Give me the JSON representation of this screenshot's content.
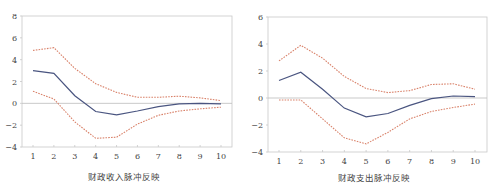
{
  "chart_data": [
    {
      "type": "line",
      "title": "财政收入脉冲反映",
      "xlabel": "财政收入脉冲反映",
      "ylabel": "",
      "x": [
        1,
        2,
        3,
        4,
        5,
        6,
        7,
        8,
        9,
        10
      ],
      "xticks": [
        "1",
        "2",
        "3",
        "4",
        "5",
        "6",
        "7",
        "8",
        "9",
        "10"
      ],
      "yticks": [
        8,
        6,
        4,
        2,
        0,
        -2,
        -4
      ],
      "ylim": [
        -4,
        8
      ],
      "grid": false,
      "zero_line": true,
      "series": [
        {
          "name": "impulse response",
          "style": "solid",
          "color": "#4a5580",
          "values": [
            3.0,
            2.75,
            0.7,
            -0.75,
            -1.05,
            -0.7,
            -0.3,
            -0.05,
            0.0,
            -0.05
          ]
        },
        {
          "name": "upper band",
          "style": "dashed",
          "color": "#d9826a",
          "values": [
            4.85,
            5.1,
            3.2,
            1.8,
            1.0,
            0.55,
            0.55,
            0.65,
            0.5,
            0.25
          ]
        },
        {
          "name": "lower band",
          "style": "dashed",
          "color": "#d9826a",
          "values": [
            1.1,
            0.4,
            -1.7,
            -3.2,
            -3.1,
            -1.9,
            -1.1,
            -0.7,
            -0.5,
            -0.35
          ]
        }
      ]
    },
    {
      "type": "line",
      "title": "财政支出脉冲反映",
      "xlabel": "财政支出脉冲反映",
      "ylabel": "",
      "x": [
        1,
        2,
        3,
        4,
        5,
        6,
        7,
        8,
        9,
        10
      ],
      "xticks": [
        "1",
        "2",
        "3",
        "4",
        "5",
        "6",
        "7",
        "8",
        "9",
        "10"
      ],
      "yticks": [
        6,
        4,
        2,
        0,
        -2,
        -4
      ],
      "ylim": [
        -4,
        6
      ],
      "grid": false,
      "zero_line": true,
      "series": [
        {
          "name": "impulse response",
          "style": "solid",
          "color": "#4a5580",
          "values": [
            1.3,
            1.9,
            0.65,
            -0.75,
            -1.4,
            -1.15,
            -0.55,
            -0.05,
            0.15,
            0.1
          ]
        },
        {
          "name": "upper band",
          "style": "dashed",
          "color": "#d9826a",
          "values": [
            2.75,
            3.9,
            2.95,
            1.6,
            0.7,
            0.4,
            0.55,
            1.0,
            1.05,
            0.65
          ]
        },
        {
          "name": "lower band",
          "style": "dashed",
          "color": "#d9826a",
          "values": [
            -0.15,
            -0.15,
            -1.55,
            -2.95,
            -3.4,
            -2.55,
            -1.55,
            -1.0,
            -0.7,
            -0.45
          ]
        }
      ]
    }
  ],
  "layout": [
    {
      "plot": {
        "left": 22,
        "top": 16,
        "right": 232,
        "bottom": 147
      },
      "x_first": 33,
      "x_last": 221,
      "caption_left": 88,
      "caption_top": 170
    },
    {
      "plot": {
        "left": 20,
        "top": 17,
        "right": 239,
        "bottom": 152
      },
      "x_first": 31,
      "x_last": 227,
      "caption_left": 90,
      "caption_top": 171
    }
  ],
  "colors": {
    "axis": "#c8c8c8",
    "zero_line": "#bbbbbb",
    "center": "#4a5580",
    "band": "#d9826a"
  }
}
